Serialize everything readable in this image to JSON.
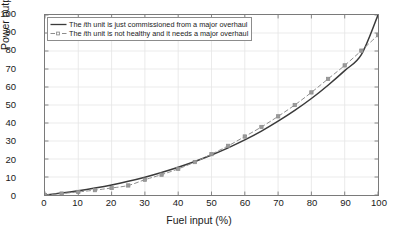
{
  "chart_data": {
    "type": "line",
    "title": "",
    "xlabel": "Fuel input (%)",
    "ylabel": "Power output (%)",
    "xlim": [
      0,
      100
    ],
    "ylim": [
      0,
      100
    ],
    "xticks": [
      0,
      10,
      20,
      30,
      40,
      50,
      60,
      70,
      80,
      90,
      100
    ],
    "yticks": [
      0,
      10,
      20,
      30,
      40,
      50,
      60,
      70,
      80,
      90,
      100
    ],
    "grid": true,
    "legend_position": "top-left",
    "x": [
      0,
      5,
      10,
      15,
      20,
      25,
      30,
      35,
      40,
      45,
      50,
      55,
      60,
      65,
      70,
      75,
      80,
      85,
      90,
      95,
      100
    ],
    "series": [
      {
        "name": "The ith unit is just commissioned from a major overhaul",
        "style": "solid",
        "color": "#3a3a3a",
        "marker": "none",
        "values": [
          0,
          1.1,
          2.4,
          3.9,
          5.6,
          7.6,
          9.9,
          12.5,
          15.4,
          18.6,
          22.2,
          26.2,
          30.6,
          35.5,
          41.0,
          47.0,
          53.6,
          61.0,
          69.1,
          78.0,
          88.0
        ]
      },
      {
        "name": "The ith unit is not healthy and it needs a major overhaul",
        "style": "dashed",
        "color": "#8c8c8c",
        "marker": "square",
        "values": [
          0,
          0.8,
          1.7,
          2.7,
          3.9,
          5.3,
          8.5,
          11.3,
          14.5,
          18.3,
          22.7,
          27.3,
          32.5,
          37.8,
          43.7,
          50.0,
          57.0,
          64.5,
          72.0,
          80.2,
          88.8
        ]
      }
    ],
    "series_solid_endpoint": 100
  },
  "legend": {
    "items": [
      {
        "prefix": "The ",
        "italic": "i",
        "suffix": "th unit is just commissioned from a major overhaul",
        "full": "The ith unit is just commissioned from a major overhaul"
      },
      {
        "prefix": "The ",
        "italic": "i",
        "suffix": "th unit is not healthy and it needs a major overhaul",
        "full": "The ith unit is not healthy and it needs a major overhaul"
      }
    ]
  },
  "colors": {
    "solid_line": "#3a3a3a",
    "dashed_line": "#8c8c8c",
    "marker_fill": "#9a9a9a",
    "grid": "#e6e6e6",
    "axis": "#7a7a7a",
    "text": "#1a1a1a",
    "background": "#ffffff"
  }
}
